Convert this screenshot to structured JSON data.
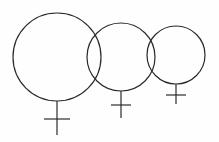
{
  "diagram": {
    "stroke_color": "#2a2a2a",
    "background": "#fefefe",
    "symbols": [
      {
        "name": "venus-symbol-large",
        "cx": 57,
        "cy": 57,
        "r": 44,
        "stem_end": 135,
        "bar_y": 119,
        "bar_half": 13
      },
      {
        "name": "venus-symbol-medium",
        "cx": 121,
        "cy": 57,
        "r": 34,
        "stem_end": 118,
        "bar_y": 105,
        "bar_half": 10
      },
      {
        "name": "venus-symbol-small",
        "cx": 176,
        "cy": 55,
        "r": 29,
        "stem_end": 104,
        "bar_y": 95,
        "bar_half": 10
      }
    ]
  }
}
